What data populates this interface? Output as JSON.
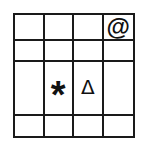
{
  "grid": {
    "rows": 4,
    "cols": 4,
    "symbols": {
      "r0c3": "@",
      "r2c1": "*",
      "r2c2": "Δ"
    }
  }
}
